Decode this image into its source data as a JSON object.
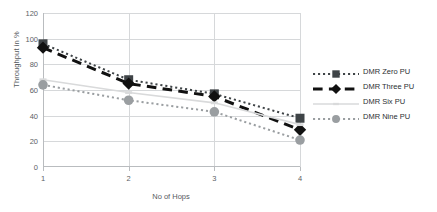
{
  "chart_data": {
    "type": "line",
    "title": "",
    "xlabel": "No of Hops",
    "ylabel": "Throughput in %",
    "categories": [
      1,
      2,
      3,
      4
    ],
    "xticklabels": [
      "1",
      "2",
      "3",
      "4"
    ],
    "yticklabels": [
      "0",
      "20",
      "40",
      "60",
      "80",
      "100",
      "120"
    ],
    "yticks": [
      0,
      20,
      40,
      60,
      80,
      100,
      120
    ],
    "ylim": [
      0,
      120
    ],
    "xlim": [
      1,
      4
    ],
    "grid": true,
    "legend_position": "right",
    "series": [
      {
        "name": "DMR  Zero PU",
        "values": [
          96,
          68,
          57,
          38
        ],
        "color": "#3f4447",
        "marker": "square",
        "linestyle": "dotted"
      },
      {
        "name": "DMR Three PU",
        "values": [
          93,
          65,
          55,
          29
        ],
        "color": "#111111",
        "marker": "diamond",
        "linestyle": "dashed"
      },
      {
        "name": "DMR Six PU",
        "values": [
          68,
          58,
          50,
          33
        ],
        "color": "#d9dadb",
        "marker": "dash",
        "linestyle": "solid"
      },
      {
        "name": "DMR Nine PU",
        "values": [
          64,
          52,
          43,
          21
        ],
        "color": "#9a9ea1",
        "marker": "circle",
        "linestyle": "dotted"
      }
    ]
  },
  "legend": {
    "items": [
      {
        "label": "DMR  Zero PU"
      },
      {
        "label": "DMR Three PU"
      },
      {
        "label": "DMR Six PU"
      },
      {
        "label": "DMR Nine PU"
      }
    ]
  },
  "axes": {
    "y_title": "Throughput in %",
    "x_title": "No of Hops"
  }
}
